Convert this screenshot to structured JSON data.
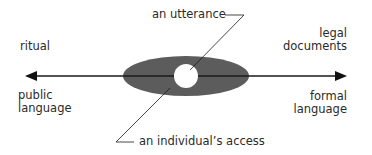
{
  "diagram": {
    "axis": {
      "left_top_label": "ritual",
      "left_bottom_label": [
        "public",
        "language"
      ],
      "right_top_label": [
        "legal",
        "documents"
      ],
      "right_bottom_label": [
        "formal",
        "language"
      ]
    },
    "callouts": {
      "utterance": "an utterance",
      "access": "an individual’s access"
    },
    "colors": {
      "ellipse_fill": "#5a5a5a",
      "circle_fill": "#ffffff",
      "line": "#1a1a1a",
      "text": "#2a2a2a"
    }
  }
}
